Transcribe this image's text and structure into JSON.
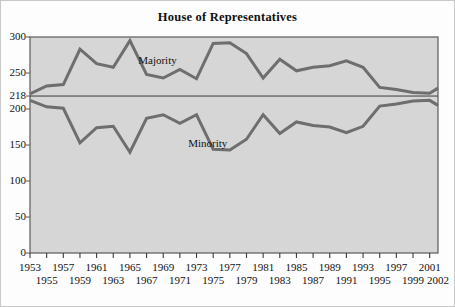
{
  "figure": {
    "title": "House of Representatives",
    "background": "#fdfdfd",
    "plot_background": "#d6d6d6",
    "frame_color": "#5a5a5a",
    "line_color": "#6e6e6e",
    "reference_line_color": "#3a3a3a"
  },
  "chart_data": {
    "type": "line",
    "title": "House of Representatives",
    "xlabel": "",
    "ylabel": "",
    "xlim": [
      1953,
      2002
    ],
    "ylim": [
      0,
      300
    ],
    "yticks": [
      0,
      50,
      100,
      150,
      200,
      218,
      250,
      300
    ],
    "ytick_labels": [
      "0",
      "50",
      "100",
      "150",
      "200",
      "218",
      "250",
      "300"
    ],
    "grid": false,
    "legend": "inline-annotation",
    "reference_line": {
      "value": 218,
      "label": "218",
      "note": "majority threshold"
    },
    "x": [
      1953,
      1955,
      1957,
      1959,
      1961,
      1963,
      1965,
      1967,
      1969,
      1971,
      1973,
      1975,
      1977,
      1979,
      1981,
      1983,
      1985,
      1987,
      1989,
      1991,
      1993,
      1995,
      1997,
      1999,
      2001,
      2002
    ],
    "xtick_labels_top": [
      "1953",
      "1957",
      "1961",
      "1965",
      "1969",
      "1973",
      "1977",
      "1981",
      "1985",
      "1989",
      "1993",
      "1997",
      "2001"
    ],
    "xtick_labels_bottom": [
      "1955",
      "1959",
      "1963",
      "1967",
      "1971",
      "1975",
      "1979",
      "1983",
      "1987",
      "1991",
      "1995",
      "1999",
      "2002"
    ],
    "series": [
      {
        "name": "Majority",
        "label_x": 1966,
        "label_y": 266,
        "values": [
          221,
          232,
          234,
          283,
          263,
          258,
          295,
          248,
          243,
          255,
          242,
          291,
          292,
          277,
          243,
          269,
          253,
          258,
          260,
          267,
          258,
          230,
          227,
          223,
          222,
          229
        ]
      },
      {
        "name": "Minority",
        "label_x": 1972,
        "label_y": 152,
        "values": [
          212,
          203,
          201,
          153,
          174,
          176,
          140,
          187,
          192,
          180,
          192,
          144,
          143,
          158,
          192,
          166,
          182,
          177,
          175,
          167,
          176,
          204,
          207,
          211,
          212,
          205
        ]
      }
    ]
  },
  "annotations": {
    "majority": "Majority",
    "minority": "Minority"
  }
}
